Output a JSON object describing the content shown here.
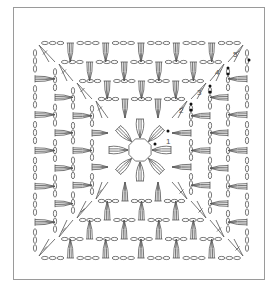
{
  "diagram": {
    "type": "crochet-granny-square-chart",
    "stroke_color": "#555555",
    "frame_color": "#9a9a9a",
    "marker_color": "#111111",
    "round_labels": [
      {
        "text": "1",
        "x": 166,
        "y": 144
      },
      {
        "text": "2",
        "x": 179,
        "y": 113
      },
      {
        "text": "3",
        "x": 197,
        "y": 95
      },
      {
        "text": "4",
        "x": 215,
        "y": 75
      },
      {
        "text": "5",
        "x": 233,
        "y": 57
      }
    ],
    "rounds": [
      {
        "round": 2,
        "left": 92,
        "top": 99,
        "right": 191,
        "bottom": 201,
        "fans_per_side": 2
      },
      {
        "round": 3,
        "left": 73,
        "top": 81,
        "right": 210,
        "bottom": 220,
        "fans_per_side": 3
      },
      {
        "round": 4,
        "left": 55,
        "top": 62,
        "right": 228,
        "bottom": 239,
        "fans_per_side": 4
      },
      {
        "round": 5,
        "left": 35,
        "top": 43,
        "right": 247,
        "bottom": 258,
        "fans_per_side": 5
      }
    ],
    "center": {
      "x": 140,
      "y": 150,
      "ring_radius": 12,
      "petals": 8
    },
    "start_markers": [
      {
        "x": 155,
        "y": 144
      },
      {
        "x": 168,
        "y": 131
      },
      {
        "x": 191,
        "y": 104
      },
      {
        "x": 191,
        "y": 110
      },
      {
        "x": 210,
        "y": 86
      },
      {
        "x": 210,
        "y": 92
      },
      {
        "x": 228,
        "y": 68
      },
      {
        "x": 228,
        "y": 74
      },
      {
        "x": 249,
        "y": 60
      }
    ]
  }
}
